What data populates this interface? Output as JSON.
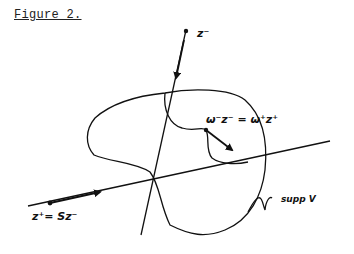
{
  "figure": {
    "title": "Figure 2.",
    "labels": {
      "z_minus": "z⁻",
      "omega_eq": "ω⁻z⁻ = ω⁺z⁺",
      "z_plus": "z⁺= Sz⁻",
      "supp": "supp V"
    },
    "colors": {
      "ink": "#111111",
      "background": "#ffffff"
    }
  }
}
